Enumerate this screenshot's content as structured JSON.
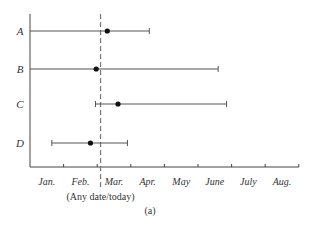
{
  "chart_data": {
    "type": "scatter",
    "subtype": "range-with-point (interval chart)",
    "title": "",
    "caption": "(a)",
    "xlabel": "",
    "ylabel": "",
    "categories": [
      "A",
      "B",
      "C",
      "D"
    ],
    "x_ticks": [
      "Jan.",
      "Feb.",
      "Mar.",
      "Apr.",
      "May",
      "June",
      "July",
      "Aug."
    ],
    "x_unit": "months elapsed from start of Jan.",
    "xlim": [
      0,
      8
    ],
    "reference_line": {
      "label": "(Any date/today)",
      "x": 2.1,
      "style": "dashed"
    },
    "series": [
      {
        "name": "A",
        "start": 0.0,
        "point": 2.3,
        "end": 3.55
      },
      {
        "name": "B",
        "start": 0.0,
        "point": 1.97,
        "end": 5.6
      },
      {
        "name": "C",
        "start": 1.95,
        "point": 2.62,
        "end": 5.85
      },
      {
        "name": "D",
        "start": 0.65,
        "point": 1.8,
        "end": 2.9
      }
    ],
    "grid": false,
    "legend": "none"
  },
  "layout": {
    "plot_left": 30,
    "plot_top": 14,
    "plot_bottom": 167,
    "plot_right": 299,
    "month_px": 33.6,
    "row_y": [
      31,
      69,
      104,
      143
    ]
  },
  "colors": {
    "line": "#555555",
    "point": "#111111",
    "axis": "#444444",
    "dash": "#777777"
  }
}
